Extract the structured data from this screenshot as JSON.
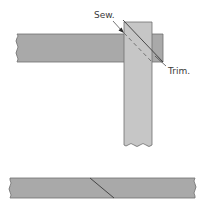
{
  "diagram": {
    "labels": {
      "sew": "Sew.",
      "trim": "Trim."
    },
    "colors": {
      "horizontal_strip": "#a9a9a9",
      "vertical_strip": "#c6c6c6",
      "bottom_strip": "#a9a9a9",
      "outline": "#6e6e6e",
      "line": "#3a3a3a"
    }
  }
}
